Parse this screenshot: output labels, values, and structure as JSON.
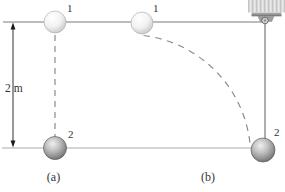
{
  "figure": {
    "scene_a": {
      "pos1": "1",
      "pos2": "2",
      "height_label": "2 m",
      "caption": "(a)"
    },
    "scene_b": {
      "pos1": "1",
      "pos2": "2",
      "caption": "(b)"
    },
    "colors": {
      "line": "#7a7a7a",
      "ground": "#ababab",
      "dash": "#8c8c8c",
      "arrow": "#1a1a1a",
      "string": "#5c5c5c",
      "ball_light_edge": "#c8c8c8",
      "ball_dark_edge": "#5f5f5f",
      "ceiling": "#d8d8d8",
      "bracket": "#9e9e9e"
    }
  }
}
